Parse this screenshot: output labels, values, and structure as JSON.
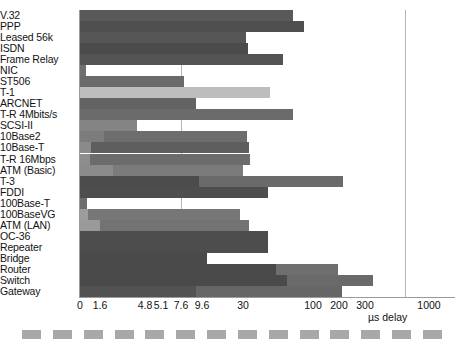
{
  "chart_data": {
    "type": "bar",
    "orientation": "horizontal",
    "title": "",
    "xlabel": "µs delay",
    "ylabel": "",
    "grid": true,
    "legend": "none",
    "axis": {
      "tick_labels": [
        "0",
        "1.6",
        "4.8",
        "5.1",
        "7.6",
        "9.6",
        "30",
        "100",
        "200",
        "300",
        "1000"
      ],
      "tick_positions_px": [
        80,
        100,
        145,
        161,
        181,
        202,
        243,
        313,
        339,
        365,
        429
      ],
      "gridline_values": [
        "9.6",
        "1000"
      ],
      "gridline_positions_px": [
        181,
        405
      ],
      "scale": "nonlinear-categorical"
    },
    "categories": [
      "V.32",
      "PPP",
      "Leased 56k",
      "ISDN",
      "Frame Relay",
      "NIC",
      "ST506",
      "T-1",
      "ARCNET",
      "T-R 4Mbits/s",
      "SCSI-II",
      "10Base2",
      "10Base-T",
      "T-R 16Mbps",
      "ATM (Basic)",
      "T-3",
      "FDDI",
      "100Base-T",
      "100BaseVG",
      "ATM (LAN)",
      "OC-36",
      "Repeater",
      "Bridge",
      "Router",
      "Switch",
      "Gateway"
    ],
    "bars": [
      {
        "label": "V.32",
        "end_px": 293,
        "segments": [
          {
            "w": 213,
            "c": "#595959"
          }
        ]
      },
      {
        "label": "PPP",
        "end_px": 304,
        "segments": [
          {
            "w": 224,
            "c": "#4f4f4f"
          }
        ]
      },
      {
        "label": "Leased 56k",
        "end_px": 246,
        "segments": [
          {
            "w": 166,
            "c": "#555555"
          }
        ]
      },
      {
        "label": "ISDN",
        "end_px": 248,
        "segments": [
          {
            "w": 168,
            "c": "#4b4b4b"
          }
        ]
      },
      {
        "label": "Frame Relay",
        "end_px": 283,
        "segments": [
          {
            "w": 203,
            "c": "#545454"
          }
        ]
      },
      {
        "label": "NIC",
        "end_px": 86,
        "segments": [
          {
            "w": 6,
            "c": "#6f6f6f"
          }
        ]
      },
      {
        "label": "ST506",
        "end_px": 184,
        "segments": [
          {
            "w": 104,
            "c": "#6a6a6a"
          }
        ]
      },
      {
        "label": "T-1",
        "end_px": 270,
        "segments": [
          {
            "w": 190,
            "c": "#bdbdbd"
          }
        ]
      },
      {
        "label": "ARCNET",
        "end_px": 196,
        "segments": [
          {
            "w": 116,
            "c": "#636363"
          }
        ]
      },
      {
        "label": "T-R 4Mbits/s",
        "end_px": 293,
        "segments": [
          {
            "w": 213,
            "c": "#6b6b6b"
          }
        ]
      },
      {
        "label": "SCSI-II",
        "end_px": 137,
        "segments": [
          {
            "w": 57,
            "c": "#848484"
          }
        ]
      },
      {
        "label": "10Base2",
        "end_px": 247,
        "segments": [
          {
            "w": 24,
            "c": "#7c7c7c"
          },
          {
            "w": 143,
            "c": "#6d6d6d"
          }
        ]
      },
      {
        "label": "10Base-T",
        "end_px": 249,
        "segments": [
          {
            "w": 11,
            "c": "#8a8a8a"
          },
          {
            "w": 158,
            "c": "#5e5e5e"
          }
        ]
      },
      {
        "label": "T-R 16Mbps",
        "end_px": 250,
        "segments": [
          {
            "w": 10,
            "c": "#8d8d8d"
          },
          {
            "w": 160,
            "c": "#6c6c6c"
          }
        ]
      },
      {
        "label": "ATM (Basic)",
        "end_px": 243,
        "segments": [
          {
            "w": 33,
            "c": "#8b8b8b"
          },
          {
            "w": 130,
            "c": "#7b7b7b"
          }
        ]
      },
      {
        "label": "T-3",
        "end_px": 343,
        "segments": [
          {
            "w": 119,
            "c": "#4c4c4c"
          },
          {
            "w": 144,
            "c": "#6a6a6a"
          }
        ]
      },
      {
        "label": "FDDI",
        "end_px": 268,
        "segments": [
          {
            "w": 188,
            "c": "#4e4e4e"
          }
        ]
      },
      {
        "label": "100Base-T",
        "end_px": 87,
        "segments": [
          {
            "w": 7,
            "c": "#6e6e6e"
          }
        ]
      },
      {
        "label": "100BaseVG",
        "end_px": 240,
        "segments": [
          {
            "w": 8,
            "c": "#9c9c9c"
          },
          {
            "w": 152,
            "c": "#777777"
          }
        ]
      },
      {
        "label": "ATM (LAN)",
        "end_px": 249,
        "segments": [
          {
            "w": 20,
            "c": "#9a9a9a"
          },
          {
            "w": 149,
            "c": "#737373"
          }
        ]
      },
      {
        "label": "OC-36",
        "end_px": 268,
        "segments": [
          {
            "w": 188,
            "c": "#4d4d4d"
          }
        ]
      },
      {
        "label": "Repeater",
        "end_px": 268,
        "segments": [
          {
            "w": 188,
            "c": "#4d4d4d"
          }
        ]
      },
      {
        "label": "Bridge",
        "end_px": 207,
        "segments": [
          {
            "w": 127,
            "c": "#4a4a4a"
          }
        ]
      },
      {
        "label": "Router",
        "end_px": 338,
        "segments": [
          {
            "w": 196,
            "c": "#4a4a4a"
          },
          {
            "w": 62,
            "c": "#6e6e6e"
          }
        ]
      },
      {
        "label": "Switch",
        "end_px": 373,
        "segments": [
          {
            "w": 207,
            "c": "#4a4a4a"
          },
          {
            "w": 86,
            "c": "#6a6a6a"
          }
        ]
      },
      {
        "label": "Gateway",
        "end_px": 342,
        "segments": [
          {
            "w": 116,
            "c": "#525252"
          },
          {
            "w": 146,
            "c": "#666666"
          }
        ]
      }
    ],
    "series_note": "Two-tone shading on some bars indicates stacked latency components",
    "footer_rule_dashes": 14
  },
  "colors": {
    "background": "#ffffff",
    "axis": "#9a9a9a",
    "gridline": "#b4b4b4",
    "text": "#121212",
    "bar_dark": "#4a4a4a",
    "bar_mid": "#6c6c6c",
    "bar_light": "#bdbdbd",
    "footer_dash": "#a8a8a8"
  }
}
